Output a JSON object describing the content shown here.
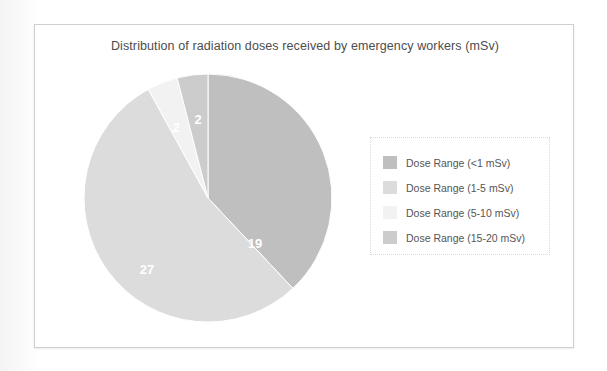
{
  "frame": {
    "border_color": "#cfcfcf",
    "background": "#ffffff"
  },
  "chart_data": {
    "type": "pie",
    "title": "Distribution of radiation doses received by emergency workers (mSv)",
    "xlabel": "",
    "ylabel": "",
    "total": 50,
    "start_angle_deg": 0,
    "direction": "clockwise",
    "legend_position": "right",
    "grid": false,
    "categories": [
      "Dose Range (<1 mSv)",
      "Dose Range (1-5 mSv)",
      "Dose Range (5-10 mSv)",
      "Dose Range (15-20 mSv)"
    ],
    "values": [
      19,
      27,
      2,
      2
    ],
    "labels": [
      "19",
      "27",
      "2",
      "2"
    ],
    "colors": [
      "#bfbfbf",
      "#dcdcdc",
      "#f2f2f2",
      "#cccccc"
    ],
    "slices": [
      {
        "name": "Dose Range (<1 mSv)",
        "value": 19,
        "label": "19",
        "color": "#bfbfbf",
        "percent": 38.0,
        "start_deg": 0,
        "sweep_deg": 136.8,
        "label_x": 172,
        "label_y": 172
      },
      {
        "name": "Dose Range (1-5 mSv)",
        "value": 27,
        "label": "27",
        "color": "#dcdcdc",
        "percent": 54.0,
        "start_deg": 136.8,
        "sweep_deg": 194.4,
        "label_x": 64,
        "label_y": 198
      },
      {
        "name": "Dose Range (5-10 mSv)",
        "value": 2,
        "label": "2",
        "color": "#f2f2f2",
        "percent": 4.0,
        "start_deg": 331.2,
        "sweep_deg": 14.4,
        "label_x": 93,
        "label_y": 56
      },
      {
        "name": "Dose Range (15-20 mSv)",
        "value": 2,
        "label": "2",
        "color": "#cccccc",
        "percent": 4.0,
        "start_deg": 345.6,
        "sweep_deg": 14.4,
        "label_x": 115,
        "label_y": 48
      }
    ],
    "geometry": {
      "center_x": 125,
      "center_y": 125,
      "radius": 124
    }
  },
  "legend": {
    "items": [
      {
        "label": "Dose Range (<1 mSv)",
        "color": "#bfbfbf"
      },
      {
        "label": "Dose Range (1-5 mSv)",
        "color": "#dcdcdc"
      },
      {
        "label": "Dose Range (5-10 mSv)",
        "color": "#f2f2f2"
      },
      {
        "label": "Dose Range (15-20 mSv)",
        "color": "#cccccc"
      }
    ]
  }
}
